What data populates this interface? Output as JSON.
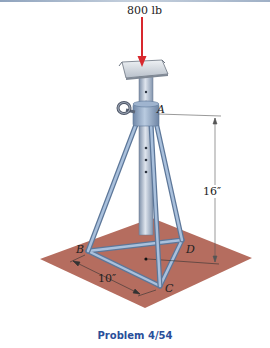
{
  "figure": {
    "load_label": "800 lb",
    "points": {
      "A": "A",
      "B": "B",
      "C": "C",
      "D": "D"
    },
    "dimensions": {
      "height": "16″",
      "base": "10″"
    },
    "caption": "Problem 4/54"
  },
  "colors": {
    "floor": "#b56d5f",
    "frame": "#8fa9c9",
    "frame_dark": "#5d7799",
    "arrow": "#d8282e",
    "caption": "#2a4f9a"
  }
}
